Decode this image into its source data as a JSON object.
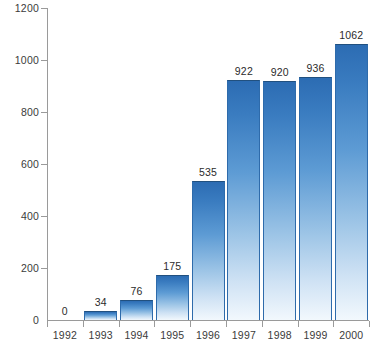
{
  "chart_data": {
    "type": "bar",
    "title": "",
    "subtitle": "",
    "xlabel": "",
    "ylabel": "",
    "categories": [
      "1992",
      "1993",
      "1994",
      "1995",
      "1996",
      "1997",
      "1998",
      "1999",
      "2000"
    ],
    "values": [
      0,
      34,
      76,
      175,
      535,
      922,
      920,
      936,
      1062
    ],
    "value_labels": [
      "0",
      "34",
      "76",
      "175",
      "535",
      "922",
      "920",
      "936",
      "1062"
    ],
    "ylim": [
      0,
      1200
    ],
    "yticks": [
      0,
      200,
      400,
      600,
      800,
      1000,
      1200
    ],
    "ytick_labels": [
      "0",
      "200",
      "400",
      "600",
      "800",
      "1000",
      "1200"
    ],
    "grid": false,
    "legend": null,
    "legend_position": "none",
    "bar_gradient_top_color": "#2c6cb3",
    "bar_gradient_bottom_color": "#f2f8fd",
    "bar_edge_color": "#2e6bab",
    "axis_color": "#9a9a9a",
    "text_color": "#3b3b3b",
    "background_color": "#ffffff"
  }
}
